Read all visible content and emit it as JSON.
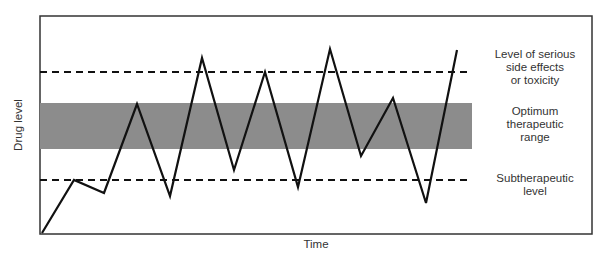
{
  "chart_data": {
    "type": "line",
    "title": "",
    "xlabel": "Time",
    "ylabel": "Drug level",
    "grid": false,
    "axis_ticks": "none",
    "frame": {
      "left": 40,
      "top": 16,
      "right": 592,
      "bottom": 234
    },
    "reference_lines": [
      {
        "name": "toxicity",
        "style": "dashed",
        "y_px": 72,
        "label": [
          "Level of serious",
          "side effects",
          "or toxicity"
        ]
      },
      {
        "name": "subtherapeutic",
        "style": "dashed",
        "y_px": 180,
        "label": [
          "Subtherapeutic",
          "level"
        ]
      }
    ],
    "bands": [
      {
        "name": "optimum-therapeutic-range",
        "y_top_px": 103,
        "y_bottom_px": 149,
        "color": "#8c8c8c",
        "label": [
          "Optimum",
          "therapeutic",
          "range"
        ]
      }
    ],
    "reference_extent_x": [
      40,
      472
    ],
    "series": [
      {
        "name": "Drug level",
        "color": "#111111",
        "points_px": [
          [
            42,
            233
          ],
          [
            74,
            180
          ],
          [
            104,
            193
          ],
          [
            137,
            104
          ],
          [
            170,
            196
          ],
          [
            202,
            58
          ],
          [
            234,
            170
          ],
          [
            265,
            72
          ],
          [
            298,
            187
          ],
          [
            330,
            49
          ],
          [
            361,
            156
          ],
          [
            393,
            98
          ],
          [
            426,
            203
          ],
          [
            457,
            50
          ]
        ]
      }
    ]
  },
  "labels": {
    "x_axis": "Time",
    "y_axis": "Drug level",
    "toxicity": [
      "Level of serious",
      "side effects",
      "or toxicity"
    ],
    "optimum": [
      "Optimum",
      "therapeutic",
      "range"
    ],
    "subtherapeutic": [
      "Subtherapeutic",
      "level"
    ]
  }
}
